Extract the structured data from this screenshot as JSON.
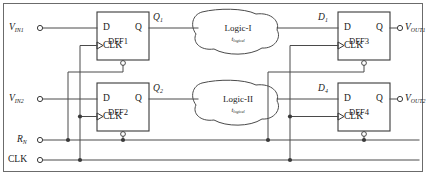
{
  "diagram": {
    "colors": {
      "wire": "#4a4a4a",
      "block_stroke": "#3a3a3a",
      "text": "#1a1a1a",
      "frame": "#6b6b6b",
      "background": "#ffffff"
    },
    "inputs": [
      {
        "id": "vin1",
        "label": "V",
        "sub": "IN1"
      },
      {
        "id": "vin2",
        "label": "V",
        "sub": "IN2"
      },
      {
        "id": "rn",
        "label": "R",
        "sub": "N"
      },
      {
        "id": "clk",
        "label": "CLK",
        "sub": ""
      }
    ],
    "outputs": [
      {
        "id": "vout1",
        "label": "V",
        "sub": "OUT1"
      },
      {
        "id": "vout2",
        "label": "V",
        "sub": "OUT2"
      }
    ],
    "flipflops": [
      {
        "id": "dff1",
        "name": "DFF1",
        "d_pin": "D",
        "q_pin": "Q",
        "clk_pin": "CLK",
        "out_signal": "Q",
        "out_sub": "1"
      },
      {
        "id": "dff2",
        "name": "DFF2",
        "d_pin": "D",
        "q_pin": "Q",
        "clk_pin": "CLK",
        "out_signal": "Q",
        "out_sub": "2"
      },
      {
        "id": "dff3",
        "name": "DFF3",
        "d_pin": "D",
        "q_pin": "Q",
        "clk_pin": "CLK",
        "in_signal": "D",
        "in_sub": "1"
      },
      {
        "id": "dff4",
        "name": "DFF4",
        "d_pin": "D",
        "q_pin": "Q",
        "clk_pin": "CLK",
        "in_signal": "D",
        "in_sub": "4"
      }
    ],
    "logic_blocks": [
      {
        "id": "logic1",
        "title": "Logic-I",
        "delay": "t",
        "delay_sub": "logical"
      },
      {
        "id": "logic2",
        "title": "Logic-II",
        "delay": "t",
        "delay_sub": "logical"
      }
    ]
  }
}
